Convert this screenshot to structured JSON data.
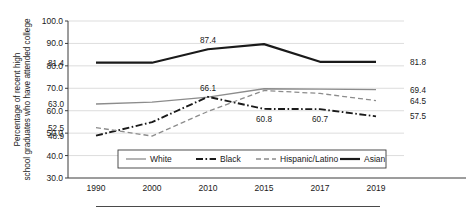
{
  "chart_data": {
    "type": "line",
    "title": "",
    "xlabel": "",
    "ylabel": "Percentage of recent high school graduates who have attended college",
    "categories": [
      "1990",
      "2000",
      "2010",
      "2015",
      "2017",
      "2019"
    ],
    "ylim": [
      30.0,
      100.0
    ],
    "ytick_step": 10.0,
    "yticks": [
      "30.0",
      "40.0",
      "50.0",
      "60.0",
      "70.0",
      "80.0",
      "90.0",
      "100.0"
    ],
    "grid": true,
    "legend_position": "bottom-inside",
    "series": [
      {
        "name": "White",
        "style": "solid-light",
        "color": "#8c8c8c",
        "values": [
          63.0,
          63.8,
          66.1,
          69.8,
          69.6,
          69.4
        ],
        "labels": [
          {
            "category": "1990",
            "value": 63.0,
            "text": "63.0",
            "position": "left"
          },
          {
            "category": "2010",
            "value": 66.1,
            "text": "66.1",
            "position": "above"
          },
          {
            "category": "2019",
            "value": 69.4,
            "text": "69.4",
            "position": "right"
          }
        ]
      },
      {
        "name": "Black",
        "style": "dash-dot",
        "color": "#1a1a1a",
        "values": [
          48.9,
          54.9,
          66.2,
          60.8,
          60.7,
          57.5
        ],
        "labels": [
          {
            "category": "1990",
            "value": 48.9,
            "text": "48.9",
            "position": "left"
          },
          {
            "category": "2015",
            "value": 60.8,
            "text": "60.8",
            "position": "below"
          },
          {
            "category": "2017",
            "value": 60.7,
            "text": "60.7",
            "position": "below"
          },
          {
            "category": "2019",
            "value": 57.5,
            "text": "57.5",
            "position": "right"
          }
        ]
      },
      {
        "name": "Hispanic/Latino",
        "style": "dashed",
        "color": "#8c8c8c",
        "values": [
          52.5,
          48.7,
          59.7,
          69.0,
          67.7,
          64.5
        ],
        "labels": [
          {
            "category": "1990",
            "value": 52.5,
            "text": "52.5",
            "position": "left"
          },
          {
            "category": "2019",
            "value": 64.5,
            "text": "64.5",
            "position": "right"
          }
        ]
      },
      {
        "name": "Asian",
        "style": "solid-bold",
        "color": "#1a1a1a",
        "values": [
          81.4,
          81.4,
          87.4,
          89.7,
          81.8,
          81.8
        ],
        "labels": [
          {
            "category": "1990",
            "value": 81.4,
            "text": "81.4",
            "position": "left"
          },
          {
            "category": "2010",
            "value": 87.4,
            "text": "87.4",
            "position": "above"
          },
          {
            "category": "2019",
            "value": 81.8,
            "text": "81.8",
            "position": "right"
          }
        ]
      }
    ]
  },
  "legend": {
    "items": [
      {
        "label": "White"
      },
      {
        "label": "Black"
      },
      {
        "label": "Hispanic/Latino"
      },
      {
        "label": "Asian"
      }
    ]
  }
}
